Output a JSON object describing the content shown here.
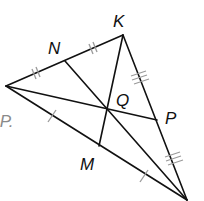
{
  "diagram": {
    "type": "triangle-medians-centroid",
    "colors": {
      "line": "#111111",
      "tick": "#9a9a9a",
      "partial_text": "#8a8a8a"
    },
    "vertices": {
      "left": {
        "x": 6,
        "y": 86
      },
      "K": {
        "x": 123,
        "y": 35
      },
      "bottom": {
        "x": 187,
        "y": 200
      }
    },
    "midpoints": {
      "N": {
        "x": 65,
        "y": 61
      },
      "P": {
        "x": 157,
        "y": 120
      },
      "M": {
        "x": 99,
        "y": 146
      }
    },
    "centroid": {
      "Q": {
        "x": 107,
        "y": 109
      }
    },
    "labels": {
      "K": "K",
      "N": "N",
      "Q": "Q",
      "P": "P",
      "M": "M",
      "partial_text": "IP."
    },
    "tick_marks": {
      "left_N": "double",
      "N_K": "double",
      "K_P": "triple",
      "P_bottom": "triple",
      "left_M": "single",
      "M_bottom": "single"
    }
  }
}
